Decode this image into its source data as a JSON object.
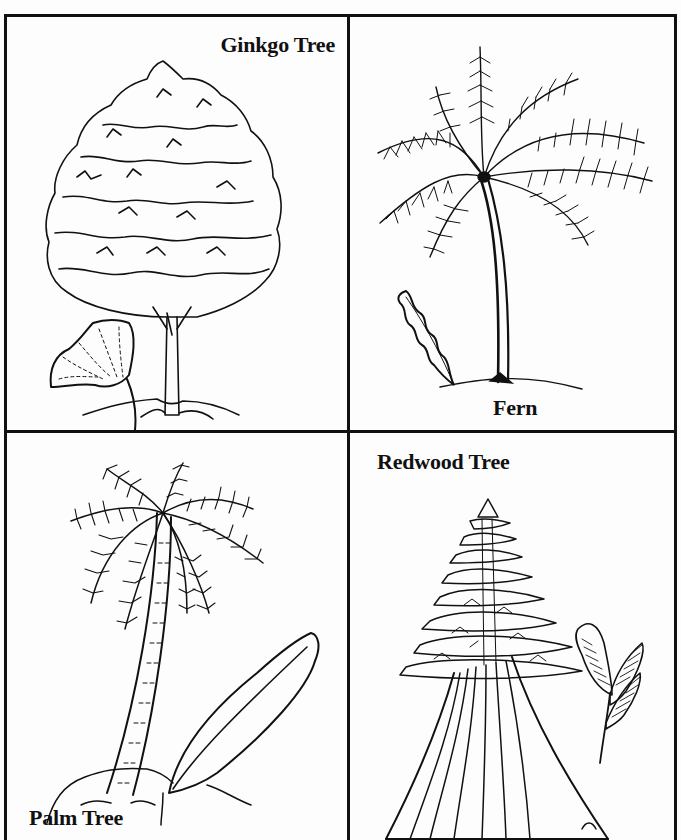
{
  "worksheet": {
    "panels": [
      {
        "id": "ginkgo",
        "label": "Ginkgo Tree",
        "position": "top-left",
        "accessories": [
          "ginkgo-leaf"
        ]
      },
      {
        "id": "fern",
        "label": "Fern",
        "position": "top-right",
        "accessories": [
          "fern-frond-leaf"
        ]
      },
      {
        "id": "palm",
        "label": "Palm Tree",
        "position": "bottom-left",
        "accessories": [
          "palm-leaf"
        ]
      },
      {
        "id": "redwood",
        "label": "Redwood Tree",
        "position": "bottom-right",
        "accessories": [
          "redwood-sprig"
        ]
      }
    ],
    "colors": {
      "ink": "#111111",
      "paper": "#fdfdfd"
    }
  }
}
